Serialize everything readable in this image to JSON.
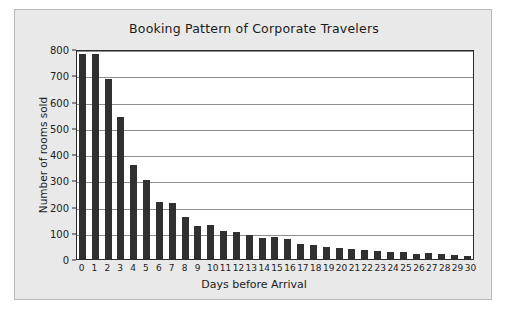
{
  "figure": {
    "background_color": "#e9e9e9",
    "border_color": "#b9b9b9",
    "plot_background_color": "#ffffff"
  },
  "chart_data": {
    "type": "bar",
    "title": "Booking Pattern of Corporate Travelers",
    "xlabel": "Days before Arrival",
    "ylabel": "Number of rooms sold",
    "categories": [
      "0",
      "1",
      "2",
      "3",
      "4",
      "5",
      "6",
      "7",
      "8",
      "9",
      "10",
      "11",
      "12",
      "13",
      "14",
      "15",
      "16",
      "17",
      "18",
      "19",
      "20",
      "21",
      "22",
      "23",
      "24",
      "25",
      "26",
      "27",
      "28",
      "29",
      "30"
    ],
    "values": [
      780,
      782,
      685,
      540,
      360,
      302,
      218,
      215,
      160,
      127,
      128,
      105,
      104,
      93,
      80,
      82,
      76,
      58,
      52,
      45,
      41,
      39,
      34,
      31,
      28,
      27,
      21,
      23,
      19,
      14,
      13
    ],
    "series": [
      {
        "name": "Number of rooms sold",
        "values": [
          780,
          782,
          685,
          540,
          360,
          302,
          218,
          215,
          160,
          127,
          128,
          105,
          104,
          93,
          80,
          82,
          76,
          58,
          52,
          45,
          41,
          39,
          34,
          31,
          28,
          27,
          21,
          23,
          19,
          14,
          13
        ]
      }
    ],
    "ylim": [
      0,
      800
    ],
    "ytick_labels": [
      "800",
      "700",
      "600",
      "500",
      "400",
      "300",
      "200",
      "100",
      "0"
    ],
    "ytick_values": [
      800,
      700,
      600,
      500,
      400,
      300,
      200,
      100,
      0
    ],
    "grid": "horizontal",
    "legend": "none",
    "bar_color": "#303030",
    "gridline_color": "#8d8d8d",
    "axis_color": "#2b2b2b"
  }
}
